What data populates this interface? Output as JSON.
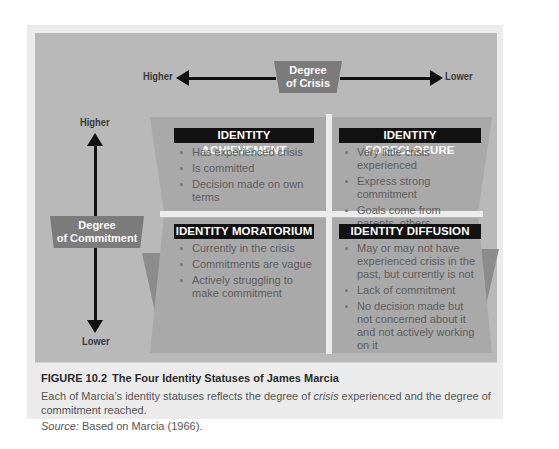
{
  "figure": {
    "crisis_axis": {
      "label_line1": "Degree",
      "label_line2": "of Crisis",
      "left_end": "Higher",
      "right_end": "Lower"
    },
    "commitment_axis": {
      "label_line1": "Degree",
      "label_line2": "of Commitment",
      "top_end": "Higher",
      "bottom_end": "Lower"
    },
    "quadrants": [
      {
        "title": "IDENTITY ACHIEVEMENT",
        "items": [
          "Has experienced crisis",
          "Is committed",
          "Decision made on own terms"
        ]
      },
      {
        "title": "IDENTITY FORECLOSURE",
        "items": [
          "Very little crisis experienced",
          "Express strong commitment",
          "Goals come from parents, others"
        ]
      },
      {
        "title": "IDENTITY MORATORIUM",
        "items": [
          "Currently in the crisis",
          "Commitments are vague",
          "Actively struggling to make commitment"
        ]
      },
      {
        "title": "IDENTITY DIFFUSION",
        "items": [
          "May or may not have experienced crisis in the past, but currently is not",
          "Lack of commitment",
          "No decision made but not concerned about it and not actively working on it"
        ]
      }
    ]
  },
  "caption": {
    "number": "FIGURE 10.2",
    "title": "The Four Identity Statuses of James Marcia",
    "body_before": "Each of Marcia’s identity statuses reflects the degree of ",
    "body_em": "crisis",
    "body_after": " experienced and the degree of commitment reached.",
    "source_label": "Source:",
    "source_text": "Based on Marcia (1966)."
  },
  "colors": {
    "panel": "#b9b9b9",
    "quadrant": "#a9a9a9",
    "tag": "#7b7b7b",
    "title_bar": "#111111"
  }
}
